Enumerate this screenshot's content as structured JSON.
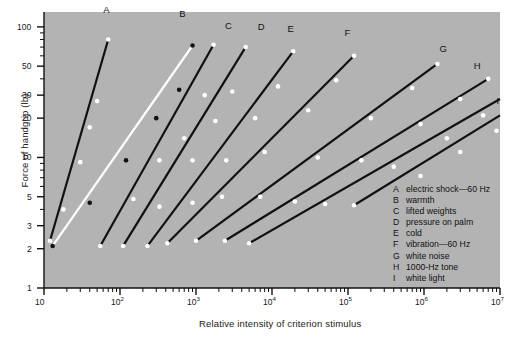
{
  "figure": {
    "background_color": "#ffffff",
    "plot_background_color": "#b3b3b3",
    "line_color": "#111111",
    "point_color": "#ffffff",
    "highlight_line_color": "#ffffff",
    "axis_color": "#111111"
  },
  "axes": {
    "x_title": "Relative intensity of criterion stimulus",
    "y_title": "Force of handgrip (lb)",
    "x_tick_labels": [
      "10",
      "10<sup>2</sup>",
      "10<sup>3</sup>",
      "10<sup>4</sup>",
      "10<sup>5</sup>",
      "10<sup>6</sup>",
      "10<sup>7</sup>"
    ],
    "x_tick_values": [
      10,
      100,
      1000,
      10000,
      100000,
      1000000,
      10000000
    ],
    "y_tick_labels": [
      "100",
      "50",
      "30",
      "20",
      "10",
      "5",
      "3",
      "2",
      "1"
    ],
    "y_tick_values": [
      100,
      50,
      30,
      20,
      10,
      5,
      3,
      2,
      1
    ],
    "x_scale": "log",
    "y_scale": "log",
    "xlim": [
      10,
      10000000
    ],
    "ylim": [
      1,
      130
    ],
    "grid": false
  },
  "legend": {
    "position": "inside-bottom-right",
    "entries": [
      {
        "key": "A",
        "label": "electric shock—60 Hz"
      },
      {
        "key": "B",
        "label": "warmth"
      },
      {
        "key": "C",
        "label": "lifted weights"
      },
      {
        "key": "D",
        "label": "pressure on palm"
      },
      {
        "key": "E",
        "label": "cold"
      },
      {
        "key": "F",
        "label": "vibration—60 Hz"
      },
      {
        "key": "G",
        "label": "white noise"
      },
      {
        "key": "H",
        "label": "1000-Hz tone"
      },
      {
        "key": "I",
        "label": "white light"
      }
    ]
  },
  "chart_data": {
    "type": "line",
    "title": "",
    "xlabel": "Relative intensity of criterion stimulus",
    "ylabel": "Force of handgrip (lb)",
    "x_scale": "log",
    "y_scale": "log",
    "xlim": [
      10,
      10000000
    ],
    "ylim": [
      1,
      130
    ],
    "grid": false,
    "note": "Cross-modality matching: force of handgrip matched to nine criterion stimuli (Stevens). Each line is a power function; slope equals ratio of exponents.",
    "series": [
      {
        "name": "A",
        "label": "electric shock—60 Hz",
        "exponent": 2.0,
        "style": "solid-dark",
        "label_xy": [
          60,
          120
        ],
        "points": [
          {
            "x": 12,
            "y": 2.3
          },
          {
            "x": 18,
            "y": 4.0
          },
          {
            "x": 30,
            "y": 9.2
          },
          {
            "x": 40,
            "y": 17
          },
          {
            "x": 50,
            "y": 27
          },
          {
            "x": 70,
            "y": 80
          }
        ]
      },
      {
        "name": "B",
        "label": "warmth",
        "exponent": 1.45,
        "style": "solid-white",
        "label_xy": [
          600,
          110
        ],
        "points": [
          {
            "x": 13,
            "y": 2.1
          },
          {
            "x": 40,
            "y": 4.5
          },
          {
            "x": 120,
            "y": 9.5
          },
          {
            "x": 300,
            "y": 20
          },
          {
            "x": 600,
            "y": 33
          },
          {
            "x": 900,
            "y": 72
          }
        ]
      },
      {
        "name": "B2",
        "label": "warmth-companion",
        "exponent": 1.3,
        "style": "solid-dark",
        "label_xy": [
          900,
          90
        ],
        "points": [
          {
            "x": 55,
            "y": 2.1
          },
          {
            "x": 150,
            "y": 4.8
          },
          {
            "x": 330,
            "y": 9.5
          },
          {
            "x": 700,
            "y": 14
          },
          {
            "x": 1300,
            "y": 30
          },
          {
            "x": 1700,
            "y": 73
          }
        ]
      },
      {
        "name": "C",
        "label": "lifted weights",
        "exponent": 1.1,
        "style": "solid-dark",
        "label_xy": [
          2400,
          90
        ],
        "points": [
          {
            "x": 110,
            "y": 2.1
          },
          {
            "x": 330,
            "y": 4.2
          },
          {
            "x": 900,
            "y": 9.5
          },
          {
            "x": 1800,
            "y": 19
          },
          {
            "x": 3000,
            "y": 32
          },
          {
            "x": 4500,
            "y": 70
          }
        ]
      },
      {
        "name": "D",
        "label": "pressure on palm",
        "exponent": 0.9,
        "style": "solid-dark",
        "label_xy": [
          6500,
          88
        ],
        "points": [
          {
            "x": 230,
            "y": 2.1
          },
          {
            "x": 900,
            "y": 4.5
          },
          {
            "x": 2500,
            "y": 9.5
          },
          {
            "x": 6000,
            "y": 20
          },
          {
            "x": 12000,
            "y": 35
          },
          {
            "x": 19000,
            "y": 65
          }
        ]
      },
      {
        "name": "E",
        "label": "cold",
        "exponent": 0.78,
        "style": "solid-dark",
        "label_xy": [
          16000,
          85
        ],
        "points": [
          {
            "x": 420,
            "y": 2.2
          },
          {
            "x": 2200,
            "y": 5.0
          },
          {
            "x": 8000,
            "y": 11
          },
          {
            "x": 30000,
            "y": 23
          },
          {
            "x": 70000,
            "y": 39
          },
          {
            "x": 120000,
            "y": 60
          }
        ]
      },
      {
        "name": "F",
        "label": "vibration—60 Hz",
        "exponent": 0.62,
        "style": "solid-dark",
        "label_xy": [
          90000,
          80
        ],
        "points": [
          {
            "x": 1000,
            "y": 2.3
          },
          {
            "x": 7000,
            "y": 5.0
          },
          {
            "x": 40000,
            "y": 10
          },
          {
            "x": 200000,
            "y": 20
          },
          {
            "x": 700000,
            "y": 34
          },
          {
            "x": 1500000,
            "y": 52
          }
        ]
      },
      {
        "name": "G",
        "label": "white noise",
        "exponent": 0.48,
        "style": "solid-dark",
        "label_xy": [
          1600000,
          60
        ],
        "points": [
          {
            "x": 2400,
            "y": 2.3
          },
          {
            "x": 20000,
            "y": 4.6
          },
          {
            "x": 150000,
            "y": 9.5
          },
          {
            "x": 900000,
            "y": 18
          },
          {
            "x": 3000000,
            "y": 28
          },
          {
            "x": 7000000,
            "y": 40
          }
        ]
      },
      {
        "name": "H",
        "label": "1000-Hz tone",
        "exponent": 0.42,
        "style": "solid-dark",
        "label_xy": [
          4500000,
          44
        ],
        "points": [
          {
            "x": 5000,
            "y": 2.2
          },
          {
            "x": 50000,
            "y": 4.4
          },
          {
            "x": 400000,
            "y": 8.5
          },
          {
            "x": 2000000,
            "y": 14
          },
          {
            "x": 6000000,
            "y": 21
          },
          {
            "x": 12000000,
            "y": 28
          }
        ]
      },
      {
        "name": "I",
        "label": "white light",
        "exponent": 0.33,
        "style": "solid-dark",
        "label_xy": [
          9000000,
          24
        ],
        "points": [
          {
            "x": 120000,
            "y": 4.3
          },
          {
            "x": 900000,
            "y": 7.2
          },
          {
            "x": 3000000,
            "y": 11
          },
          {
            "x": 9000000,
            "y": 16
          },
          {
            "x": 20000000,
            "y": 21
          }
        ]
      }
    ]
  }
}
